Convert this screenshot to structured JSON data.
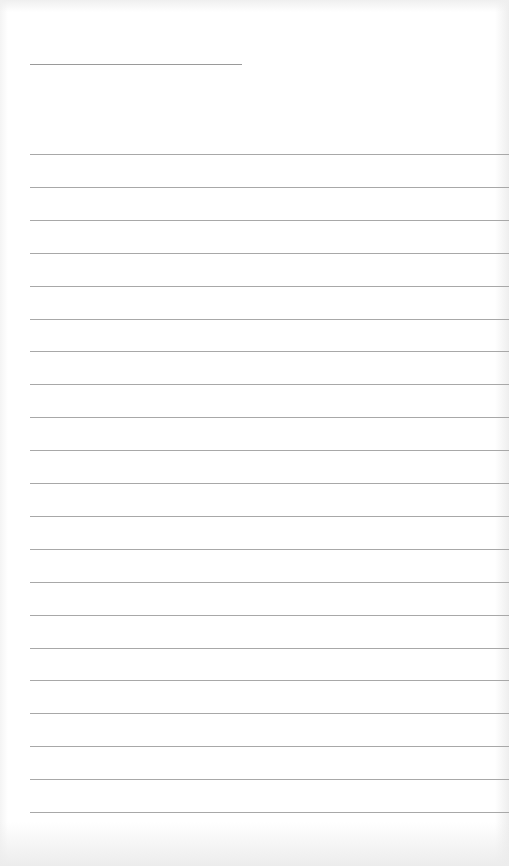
{
  "document": {
    "type": "lined-paper",
    "title_line_text": "",
    "ruled_line_count": 21,
    "lines": [
      "",
      "",
      "",
      "",
      "",
      "",
      "",
      "",
      "",
      "",
      "",
      "",
      "",
      "",
      "",
      "",
      "",
      "",
      "",
      "",
      ""
    ]
  }
}
